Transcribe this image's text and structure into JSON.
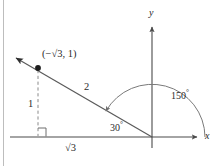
{
  "figure": {
    "type": "geometry-diagram",
    "colors": {
      "axis": "#4a4a4a",
      "ray": "#5a5a5a",
      "arc": "#7a7a7a",
      "dashed": "#8a8a8a",
      "text": "#2b2b2b",
      "border": "#bdbdbd",
      "background": "#ffffff"
    },
    "axes": {
      "x_label": "x",
      "y_label": "y",
      "origin": {
        "x": 152,
        "y": 137
      }
    },
    "point": {
      "label_open": "(",
      "label_minus": "−",
      "label_radical": "√",
      "label_radicand": "3",
      "label_comma": ", ",
      "label_y": "1",
      "label_close": ")",
      "label_full": "(−√3, 1)",
      "coords": {
        "x": 38,
        "y": 68
      }
    },
    "labels": {
      "hypotenuse": "2",
      "opposite": "1",
      "adjacent_radical": "√",
      "adjacent_radicand": "3",
      "adjacent_full": "√3",
      "reference_angle": "30",
      "reference_angle_degree": "°",
      "standard_angle": "150",
      "standard_angle_degree": "°"
    }
  }
}
